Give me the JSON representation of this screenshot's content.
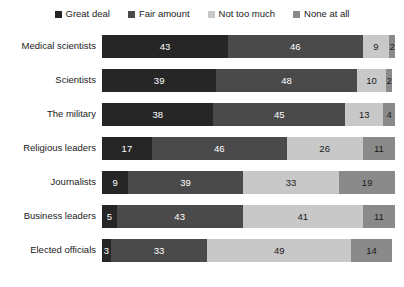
{
  "chart_data": {
    "type": "bar",
    "orientation": "horizontal",
    "stacked": true,
    "stack_total": 100,
    "title": "",
    "subtitle": "",
    "xlabel": "",
    "ylabel": "",
    "xlim": [
      0,
      100
    ],
    "grid": false,
    "legend_position": "top",
    "categories": [
      "Medical scientists",
      "Scientists",
      "The military",
      "Religious leaders",
      "Journalists",
      "Business leaders",
      "Elected officials"
    ],
    "series": [
      {
        "name": "Great deal",
        "color": "#262626",
        "text_color": "#ffffff",
        "values": [
          43,
          39,
          38,
          17,
          9,
          5,
          3
        ]
      },
      {
        "name": "Fair amount",
        "color": "#4a4a4a",
        "text_color": "#ffffff",
        "values": [
          46,
          48,
          45,
          46,
          39,
          43,
          33
        ]
      },
      {
        "name": "Not too much",
        "color": "#c8c8c8",
        "text_color": "#1b1b1b",
        "values": [
          9,
          10,
          13,
          26,
          33,
          41,
          49
        ]
      },
      {
        "name": "None at all",
        "color": "#8a8a8a",
        "text_color": "#1b1b1b",
        "values": [
          2,
          2,
          4,
          11,
          19,
          11,
          14
        ]
      }
    ]
  },
  "legend": {
    "items": [
      {
        "label": "Great deal",
        "color": "#262626"
      },
      {
        "label": "Fair amount",
        "color": "#4a4a4a"
      },
      {
        "label": "Not too much",
        "color": "#c8c8c8"
      },
      {
        "label": "None at all",
        "color": "#8a8a8a"
      }
    ]
  }
}
